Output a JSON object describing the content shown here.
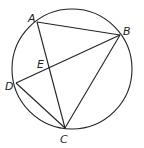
{
  "diagram": {
    "type": "inscribed-quadrilateral-in-circle",
    "circle": {
      "cx": 72,
      "cy": 69,
      "r": 60
    },
    "points": {
      "A": {
        "label": "A",
        "x": 37,
        "y": 22,
        "lx": 28,
        "ly": 22
      },
      "B": {
        "label": "B",
        "x": 120,
        "y": 35,
        "lx": 123,
        "ly": 35
      },
      "C": {
        "label": "C",
        "x": 65,
        "y": 128,
        "lx": 60,
        "ly": 143
      },
      "D": {
        "label": "D",
        "x": 16,
        "y": 83,
        "lx": 5,
        "ly": 90
      },
      "E": {
        "label": "E",
        "x": 49,
        "y": 68,
        "lx": 37,
        "ly": 68
      }
    },
    "segments": [
      "AB",
      "BC",
      "AC",
      "BD",
      "DC"
    ]
  }
}
